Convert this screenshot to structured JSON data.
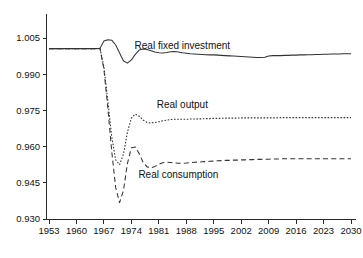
{
  "chart_data": {
    "type": "line",
    "title": "",
    "subtitle": "",
    "xlabel": "",
    "ylabel": "",
    "xlim": [
      1953,
      2030
    ],
    "ylim": [
      0.93,
      1.005
    ],
    "grid": false,
    "legend_position": "inline-annotations",
    "xticks": [
      "1953",
      "1960",
      "1967",
      "1974",
      "1981",
      "1988",
      "1995",
      "2002",
      "2009",
      "2016",
      "2023",
      "2030"
    ],
    "yticks": [
      "1.005",
      "0.990",
      "0.975",
      "0.960",
      "0.945",
      "0.930"
    ],
    "x": [
      1953,
      1954,
      1955,
      1956,
      1957,
      1958,
      1959,
      1960,
      1961,
      1962,
      1963,
      1964,
      1965,
      1966,
      1967,
      1968,
      1969,
      1970,
      1971,
      1972,
      1973,
      1974,
      1975,
      1976,
      1977,
      1978,
      1979,
      1980,
      1981,
      1982,
      1983,
      1984,
      1985,
      1986,
      1987,
      1988,
      1989,
      1990,
      1991,
      1992,
      1993,
      1994,
      1995,
      1996,
      1997,
      1998,
      1999,
      2000,
      2001,
      2002,
      2003,
      2004,
      2005,
      2006,
      2007,
      2008,
      2009,
      2010,
      2011,
      2012,
      2013,
      2014,
      2015,
      2016,
      2017,
      2018,
      2019,
      2020,
      2021,
      2022,
      2023,
      2024,
      2025,
      2026,
      2027,
      2028,
      2029,
      2030
    ],
    "series": [
      {
        "name": "Real fixed investment",
        "style": "solid",
        "annotation": "Real fixed investment",
        "values": [
          1.0006,
          1.0006,
          1.0006,
          1.0006,
          1.0006,
          1.0006,
          1.0006,
          1.0006,
          1.0006,
          1.0006,
          1.0006,
          1.0006,
          1.0006,
          1.0007,
          1.0038,
          1.0043,
          1.0041,
          1.0021,
          0.9988,
          0.9955,
          0.9946,
          0.9959,
          0.9982,
          1.0,
          1.0004,
          1.0002,
          0.9997,
          0.9992,
          0.9989,
          0.9988,
          0.999,
          0.9993,
          0.9994,
          0.9992,
          0.9989,
          0.9987,
          0.9985,
          0.9984,
          0.9983,
          0.9982,
          0.9981,
          0.998,
          0.998,
          0.9979,
          0.9978,
          0.9977,
          0.9976,
          0.9975,
          0.9974,
          0.9973,
          0.9972,
          0.9971,
          0.997,
          0.9969,
          0.9969,
          0.997,
          0.9975,
          0.9977,
          0.9977,
          0.9977,
          0.9978,
          0.9978,
          0.9979,
          0.9979,
          0.998,
          0.998,
          0.9981,
          0.9981,
          0.9982,
          0.9982,
          0.9983,
          0.9983,
          0.9984,
          0.9984,
          0.9984,
          0.9985,
          0.9985,
          0.9985
        ]
      },
      {
        "name": "Real output",
        "style": "dotted",
        "annotation": "Real output",
        "values": [
          1.0006,
          1.0006,
          1.0006,
          1.0006,
          1.0006,
          1.0006,
          1.0006,
          1.0006,
          1.0006,
          1.0006,
          1.0006,
          1.0006,
          1.0006,
          1.0007,
          0.993,
          0.979,
          0.964,
          0.9545,
          0.9525,
          0.957,
          0.966,
          0.9718,
          0.9735,
          0.9726,
          0.971,
          0.97,
          0.9698,
          0.97,
          0.9703,
          0.9707,
          0.971,
          0.9712,
          0.9713,
          0.9713,
          0.9713,
          0.9713,
          0.9714,
          0.9714,
          0.9715,
          0.9715,
          0.9716,
          0.9716,
          0.9717,
          0.9717,
          0.9717,
          0.9718,
          0.9718,
          0.9718,
          0.9718,
          0.9719,
          0.9719,
          0.9719,
          0.9719,
          0.9719,
          0.9719,
          0.9719,
          0.9719,
          0.9719,
          0.9719,
          0.972,
          0.972,
          0.972,
          0.972,
          0.972,
          0.972,
          0.972,
          0.972,
          0.972,
          0.972,
          0.972,
          0.972,
          0.972,
          0.972,
          0.972,
          0.972,
          0.972,
          0.972,
          0.972
        ]
      },
      {
        "name": "Real consumption",
        "style": "dashed",
        "annotation": "Real consumption",
        "values": [
          1.0006,
          1.0006,
          1.0006,
          1.0006,
          1.0006,
          1.0006,
          1.0006,
          1.0006,
          1.0006,
          1.0006,
          1.0006,
          1.0006,
          1.0006,
          1.0007,
          0.992,
          0.976,
          0.958,
          0.943,
          0.9368,
          0.942,
          0.953,
          0.9595,
          0.9598,
          0.957,
          0.9535,
          0.9516,
          0.9512,
          0.9518,
          0.9527,
          0.9533,
          0.9535,
          0.9534,
          0.9532,
          0.9531,
          0.9531,
          0.9532,
          0.9534,
          0.9535,
          0.9536,
          0.9537,
          0.9538,
          0.9539,
          0.954,
          0.9541,
          0.9542,
          0.9543,
          0.9543,
          0.9544,
          0.9544,
          0.9545,
          0.9545,
          0.9546,
          0.9546,
          0.9547,
          0.9547,
          0.9548,
          0.9548,
          0.9549,
          0.9549,
          0.9549,
          0.955,
          0.955,
          0.955,
          0.955,
          0.955,
          0.955,
          0.955,
          0.955,
          0.955,
          0.955,
          0.955,
          0.955,
          0.955,
          0.955,
          0.955,
          0.955,
          0.955,
          0.955
        ]
      }
    ],
    "annotations": [
      {
        "text": "Real fixed investment",
        "x": 1987,
        "y": 1.002
      },
      {
        "text": "Real output",
        "x": 1987,
        "y": 0.9775
      },
      {
        "text": "Real consumption",
        "x": 1986,
        "y": 0.9485
      }
    ]
  }
}
